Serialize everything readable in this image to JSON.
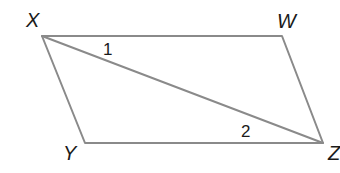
{
  "diagram": {
    "type": "parallelogram",
    "vertices": [
      {
        "name": "X",
        "x": 42,
        "y": 36,
        "label_x": 26,
        "label_y": 27
      },
      {
        "name": "W",
        "x": 282,
        "y": 36,
        "label_x": 277,
        "label_y": 28
      },
      {
        "name": "Y",
        "x": 85,
        "y": 143,
        "label_x": 63,
        "label_y": 160
      },
      {
        "name": "Z",
        "x": 323,
        "y": 143,
        "label_x": 328,
        "label_y": 160
      }
    ],
    "sides": [
      "XW",
      "WZ",
      "ZY",
      "YX"
    ],
    "diagonal": "XZ",
    "angle_labels": [
      {
        "label": "1",
        "x": 103,
        "y": 55
      },
      {
        "label": "2",
        "x": 241,
        "y": 137
      }
    ],
    "line_color": "#8a8a8a",
    "text_color": "#1a1a1a"
  }
}
